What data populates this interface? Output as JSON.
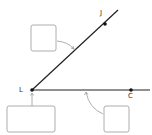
{
  "diagram": {
    "type": "angle",
    "colors": {
      "line": "#222222",
      "box": "#9a9a9a",
      "arrow": "#9a9a9a",
      "point": "#111111"
    },
    "vertex": {
      "label": "L",
      "x": 32,
      "y": 90
    },
    "ray_upper": {
      "end_x": 118,
      "end_y": 10,
      "point": {
        "label": "J",
        "x": 105,
        "y": 24
      }
    },
    "ray_lower": {
      "end_x": 150,
      "end_y": 90,
      "point": {
        "label": "C",
        "x": 131,
        "y": 90
      }
    },
    "boxes": [
      {
        "id": "ray-box",
        "x": 31,
        "y": 25,
        "w": 25,
        "h": 26,
        "text": "",
        "target": "upper ray"
      },
      {
        "id": "vertex-box",
        "x": 7,
        "y": 106,
        "w": 48,
        "h": 26,
        "text": "",
        "target": "vertex"
      },
      {
        "id": "angle-side-box",
        "x": 104,
        "y": 106,
        "w": 25,
        "h": 26,
        "text": "",
        "target": "lower ray"
      }
    ]
  }
}
